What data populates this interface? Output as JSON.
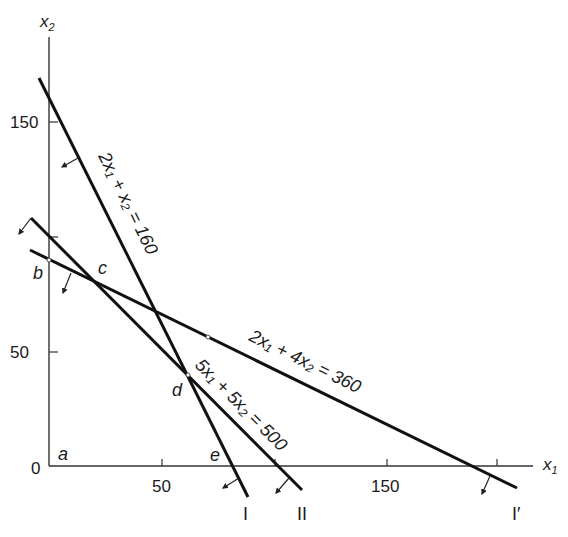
{
  "figure": {
    "type": "linear-programming-feasible-region",
    "axes": {
      "x_label": "x",
      "x_label_sub": "1",
      "y_label": "x",
      "y_label_sub": "2",
      "origin_label": "0",
      "x_ticks": [
        {
          "value": 50,
          "label": "50",
          "px": 162
        },
        {
          "value": 100,
          "label": "",
          "px": 275
        },
        {
          "value": 150,
          "label": "150",
          "px": 387
        },
        {
          "value": 200,
          "label": "",
          "px": 497
        }
      ],
      "y_ticks": [
        {
          "value": 50,
          "label": "50",
          "py": 352
        },
        {
          "value": 100,
          "label": "",
          "py": 237
        },
        {
          "value": 150,
          "label": "150",
          "py": 122
        }
      ]
    },
    "constraints": [
      {
        "id": "I",
        "equation_parts": [
          "2x",
          "1",
          " + x",
          "2",
          " = 160"
        ],
        "equation": "2x₁ + x₂ = 160",
        "line_label": "I",
        "x1": 39,
        "y1": 78,
        "x2": 248,
        "y2": 497
      },
      {
        "id": "II",
        "equation": "5x₁ + 5x₂ = 500",
        "line_label": "II",
        "x1": 31,
        "y1": 218,
        "x2": 302,
        "y2": 490
      },
      {
        "id": "I'",
        "equation": "2x₁ + 4x₂ = 360",
        "line_label": "I′",
        "x1": 30,
        "y1": 250,
        "x2": 517,
        "y2": 488
      }
    ],
    "vertex_labels": {
      "a": "a",
      "b": "b",
      "c": "c",
      "d": "d",
      "e": "e"
    },
    "colors": {
      "line": "#111111",
      "axis": "#333333",
      "background": "#ffffff"
    }
  }
}
